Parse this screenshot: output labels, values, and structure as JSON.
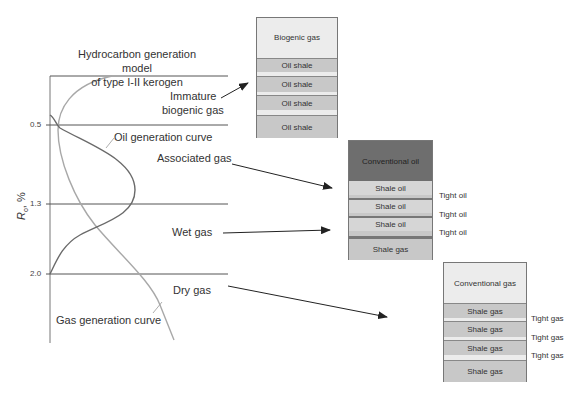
{
  "title": {
    "line1": "Hydrocarbon generation model",
    "line2": "of type I-II kerogen"
  },
  "axis": {
    "label_main": "R",
    "label_sub": "o",
    "label_unit": ", %",
    "ticks": [
      "0.5",
      "1.3",
      "2.0"
    ]
  },
  "curves": {
    "oil": "Oil generation curve",
    "gas": "Gas generation curve"
  },
  "zones": {
    "immature_line1": "Immature",
    "immature_line2": "biogenic gas",
    "associated": "Associated gas",
    "wet": "Wet gas",
    "dry": "Dry gas"
  },
  "columns": {
    "biogenic": {
      "layers": [
        "Biogenic gas",
        "Oil shale",
        "Oil shale",
        "Oil shale",
        "Oil shale"
      ]
    },
    "oil": {
      "layers": [
        "Conventional oil",
        "Shale oil",
        "Shale oil",
        "Shale oil",
        "Shale gas"
      ],
      "side_labels": [
        "Tight oil",
        "Tight oil",
        "Tight oil"
      ]
    },
    "gas": {
      "layers": [
        "Conventional gas",
        "Shale gas",
        "Shale gas",
        "Shale gas",
        "Shale gas"
      ],
      "side_labels": [
        "Tight gas",
        "Tight gas",
        "Tight gas"
      ]
    }
  },
  "colors": {
    "light": "#ececec",
    "shale": "#c8c8c8",
    "dark_oil": "#6e6e6e",
    "oil_curve": "#6a6a6a",
    "gas_curve": "#a8a8a8"
  }
}
